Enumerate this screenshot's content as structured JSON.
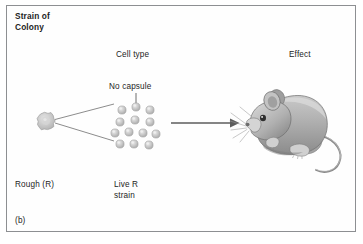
{
  "figure": {
    "letter": "(b)",
    "panel_title": "Strain of\nColony",
    "background_color": "#ffffff",
    "border_color": "#8d8f92",
    "text_color": "#1d1d1d"
  },
  "labels": {
    "strain_of_colony": "Strain of\nColony",
    "cell_type": "Cell type",
    "effect": "Effect",
    "no_capsule": "No capsule",
    "rough_r": "Rough (R)",
    "live_r_strain": "Live R\nstrain"
  },
  "diagram": {
    "colony": {
      "name": "rough-colony-blob",
      "cx": 46,
      "cy": 121,
      "radius": 8,
      "fill": "#cfcfcf",
      "stroke": "#a8a8a8"
    },
    "fan_lines": [
      {
        "x1": 55,
        "y1": 119,
        "x2": 113,
        "y2": 105
      },
      {
        "x1": 55,
        "y1": 123,
        "x2": 113,
        "y2": 140
      }
    ],
    "pointer_line": {
      "x1": 136,
      "y1": 93,
      "x2": 136,
      "y2": 106,
      "label": "No capsule"
    },
    "cells": {
      "count": 13,
      "radius": 4.1,
      "fill": "#c9c9c9",
      "highlight": "#e6e6e6",
      "stroke": "#a6a6a6",
      "positions": [
        {
          "cx": 122,
          "cy": 110
        },
        {
          "cx": 136,
          "cy": 107
        },
        {
          "cx": 150,
          "cy": 110
        },
        {
          "cx": 120,
          "cy": 122
        },
        {
          "cx": 135,
          "cy": 120
        },
        {
          "cx": 150,
          "cy": 122
        },
        {
          "cx": 115,
          "cy": 133
        },
        {
          "cx": 129,
          "cy": 132
        },
        {
          "cx": 143,
          "cy": 133
        },
        {
          "cx": 120,
          "cy": 144
        },
        {
          "cx": 134,
          "cy": 144
        },
        {
          "cx": 149,
          "cy": 145
        },
        {
          "cx": 156,
          "cy": 134
        }
      ]
    },
    "arrow": {
      "name": "effect-arrow",
      "x1": 171,
      "y1": 123,
      "x2": 236,
      "y2": 123,
      "color": "#5d5d5d"
    },
    "mouse": {
      "name": "live-mouse-illustration",
      "description": "grey mouse facing left, alive",
      "body_fill": "#b9b9b9",
      "shade_fill": "#8f8f8f",
      "light_fill": "#dcdcdc",
      "outline": "#6e6e6e"
    }
  }
}
